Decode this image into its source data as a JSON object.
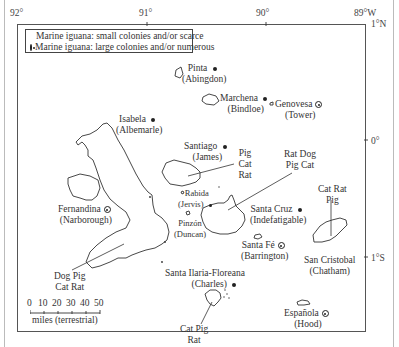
{
  "map": {
    "longitude_labels": [
      "92°",
      "91°",
      "90°",
      "89°W"
    ],
    "latitude_labels": [
      "1°N",
      "0°",
      "1°S"
    ],
    "legend": {
      "small": "Marine iguana: small colonies and/or scarce",
      "large": "Marine iguana: large colonies and/or numerous"
    },
    "islands": {
      "pinta": {
        "name": "Pinta",
        "alt": "(Abingdon)",
        "colony": "small"
      },
      "marchena": {
        "name": "Marchena",
        "alt": "(Bindloe)",
        "colony": "small"
      },
      "genovesa": {
        "name": "Genovesa",
        "alt": "(Tower)",
        "colony": "large"
      },
      "isabela": {
        "name": "Isabela",
        "alt": "(Albemarle)",
        "colony": "small"
      },
      "santiago": {
        "name": "Santiago",
        "alt": "(James)",
        "colony": "small"
      },
      "rabida": {
        "name": "Rabida",
        "alt": "(Jervis)",
        "colony": "small"
      },
      "fernandina": {
        "name": "Fernandina",
        "alt": "(Narborough)",
        "colony": "large"
      },
      "pinzon": {
        "name": "Pinzón",
        "alt": "(Duncan)",
        "colony": "none"
      },
      "santa_cruz": {
        "name": "Santa Cruz",
        "alt": "(Indefatigable)",
        "colony": "small"
      },
      "santa_fe": {
        "name": "Santa Fé",
        "alt": "(Barrington)",
        "colony": "large"
      },
      "san_cristobal": {
        "name": "San Cristobal",
        "alt": "(Chatham)",
        "colony": "none"
      },
      "floreana": {
        "name": "Santa Ilaria-Floreana",
        "alt": "(Charles)",
        "colony": "small"
      },
      "espanola": {
        "name": "Española",
        "alt": "(Hood)",
        "colony": "large"
      }
    },
    "predators": {
      "santiago": [
        "Pig",
        "Cat",
        "Rat"
      ],
      "santa_cruz": [
        "Rat Dog",
        "Pig Cat"
      ],
      "san_cristobal": [
        "Cat Rat",
        "Pig"
      ],
      "isabela": [
        "Dog Pig",
        "Cat Rat"
      ],
      "floreana": [
        "Cat Pig",
        "Rat"
      ]
    },
    "scale": {
      "ticks": [
        "0",
        "10",
        "20",
        "30",
        "40",
        "50"
      ],
      "unit": "miles (terrestrial)"
    }
  }
}
